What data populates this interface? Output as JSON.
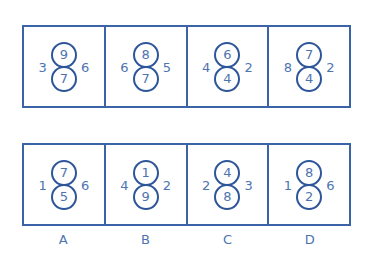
{
  "colors": {
    "line": "#3b64a8",
    "circle": "#2d569a",
    "text": "#4d74b0"
  },
  "question_row": [
    {
      "top": "9",
      "bottom": "7",
      "left": "3",
      "right": "6"
    },
    {
      "top": "8",
      "bottom": "7",
      "left": "6",
      "right": "5"
    },
    {
      "top": "6",
      "bottom": "4",
      "left": "4",
      "right": "2"
    },
    {
      "top": "7",
      "bottom": "4",
      "left": "8",
      "right": "2"
    }
  ],
  "options_row": [
    {
      "label": "A",
      "top": "7",
      "bottom": "5",
      "left": "1",
      "right": "6"
    },
    {
      "label": "B",
      "top": "1",
      "bottom": "9",
      "left": "4",
      "right": "2"
    },
    {
      "label": "C",
      "top": "4",
      "bottom": "8",
      "left": "2",
      "right": "3"
    },
    {
      "label": "D",
      "top": "8",
      "bottom": "2",
      "left": "1",
      "right": "6"
    }
  ]
}
